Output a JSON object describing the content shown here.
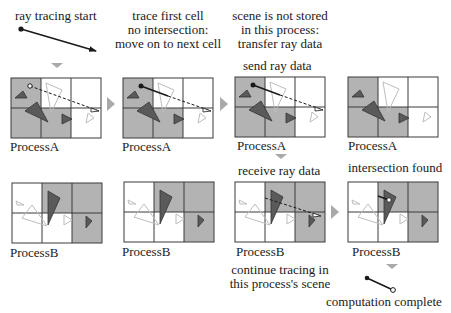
{
  "colors": {
    "shaded_cell": "#b3b3b3",
    "empty_cell": "#ffffff",
    "grid_line": "#3a3a3a",
    "solid_triangle": "#5a5a5a",
    "ghost_triangle": "#bdbdbd",
    "ray": "#1a1a1a",
    "arrow_marker": "#a9a9a9"
  },
  "captions": {
    "ray_start": "ray tracing start",
    "trace_first": [
      "trace first cell",
      "no intersection:",
      "move on to next cell"
    ],
    "not_stored": [
      "scene is not stored",
      "in this process:",
      "transfer ray data"
    ],
    "send": "send ray data",
    "receive": "receive ray data",
    "intersection": "intersection found",
    "continue": [
      "continue tracing in",
      "this process's scene"
    ],
    "complete": "computation complete"
  },
  "processes": {
    "a": "ProcessA",
    "b": "ProcessB"
  },
  "panels": [
    {
      "id": "a1",
      "process": "a",
      "shaded": [
        0,
        3,
        4
      ],
      "ray": "start-dashed"
    },
    {
      "id": "a2",
      "process": "a",
      "shaded": [
        0,
        3,
        4
      ],
      "ray": "first-cell"
    },
    {
      "id": "a3",
      "process": "a",
      "shaded": [
        0,
        3,
        4
      ],
      "ray": "send"
    },
    {
      "id": "a4",
      "process": "a",
      "shaded": [
        0,
        3,
        4
      ],
      "ray": "none"
    },
    {
      "id": "b1",
      "process": "b",
      "shaded": [
        1,
        2,
        5
      ],
      "ray": "none"
    },
    {
      "id": "b2",
      "process": "b",
      "shaded": [
        1,
        2,
        5
      ],
      "ray": "none"
    },
    {
      "id": "b3",
      "process": "b",
      "shaded": [
        1,
        2,
        5
      ],
      "ray": "receive"
    },
    {
      "id": "b4",
      "process": "b",
      "shaded": [
        1,
        2,
        5
      ],
      "ray": "hit"
    }
  ]
}
